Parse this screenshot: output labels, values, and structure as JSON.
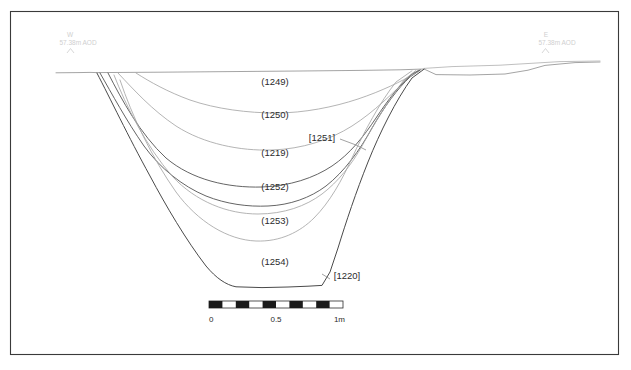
{
  "figure": {
    "type": "archaeological-section-drawing",
    "frame": {
      "x": 10,
      "y": 11,
      "width": 609,
      "height": 344,
      "stroke": "#3a3a3a"
    }
  },
  "orientation": {
    "left": {
      "compass": "W",
      "datum": "57.38m AOD",
      "marker": "benchmark-arrow"
    },
    "right": {
      "compass": "E",
      "datum": "57.38m AOD",
      "marker": "benchmark-arrow"
    }
  },
  "deposits": [
    {
      "code": "(1249)",
      "kind": "fill",
      "x": 275,
      "y": 85
    },
    {
      "code": "(1250)",
      "kind": "fill",
      "x": 275,
      "y": 118
    },
    {
      "code": "(1219)",
      "kind": "fill",
      "x": 275,
      "y": 156
    },
    {
      "code": "(1252)",
      "kind": "fill",
      "x": 275,
      "y": 190
    },
    {
      "code": "(1253)",
      "kind": "fill",
      "x": 275,
      "y": 224
    },
    {
      "code": "(1254)",
      "kind": "fill",
      "x": 275,
      "y": 265
    }
  ],
  "cuts": [
    {
      "code": "[1251]",
      "kind": "cut",
      "x": 322,
      "y": 141,
      "leader": true
    },
    {
      "code": "[1220]",
      "kind": "cut",
      "x": 347,
      "y": 279,
      "leader": true
    }
  ],
  "scale_bar": {
    "unit": "m",
    "total_length_m": 1,
    "segments": 10,
    "ticks": [
      {
        "label": "0",
        "value": 0,
        "align": "start"
      },
      {
        "label": "0.5",
        "value": 0.5,
        "align": "middle"
      },
      {
        "label": "1m",
        "value": 1,
        "align": "end"
      }
    ],
    "geometry": {
      "x": 209,
      "y": 301,
      "width": 134,
      "height": 7
    }
  },
  "colors": {
    "frame": "#3a3a3a",
    "ground_line": "#9a9a9a",
    "cut_line": "#4a4a4a",
    "fill_line": "#a6a6a6",
    "fill_line_dark": "#5c5c5c",
    "label_text": "#2b2b2b",
    "datum_text": "#cfcfcf",
    "scale_dark": "#1a1a1a",
    "background": "#ffffff"
  }
}
